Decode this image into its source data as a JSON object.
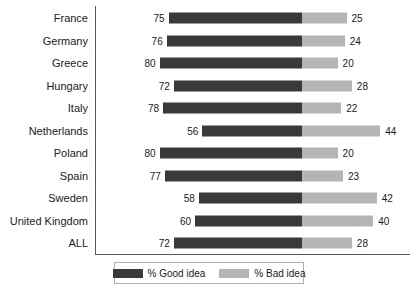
{
  "chart_data": {
    "type": "bar",
    "subtype": "stacked-horizontal-diverging",
    "title": "",
    "xlabel": "",
    "ylabel": "",
    "grid": false,
    "xlim": [
      0,
      100
    ],
    "categories": [
      "France",
      "Germany",
      "Greece",
      "Hungary",
      "Italy",
      "Netherlands",
      "Poland",
      "Spain",
      "Sweden",
      "United Kingdom",
      "ALL"
    ],
    "series": [
      {
        "name": "% Good idea",
        "color": "#3a3a3a",
        "values": [
          75,
          76,
          80,
          72,
          78,
          56,
          80,
          77,
          58,
          60,
          72
        ]
      },
      {
        "name": "% Bad idea",
        "color": "#b5b5b5",
        "values": [
          25,
          24,
          20,
          28,
          22,
          44,
          20,
          23,
          42,
          40,
          28
        ]
      }
    ],
    "legend": {
      "position": "bottom",
      "entries": [
        {
          "label": "% Good idea",
          "color": "#3a3a3a",
          "swatch": "good"
        },
        {
          "label": "% Bad idea",
          "color": "#b5b5b5",
          "swatch": "bad"
        }
      ]
    }
  },
  "colors": {
    "good": "#3a3a3a",
    "bad": "#b5b5b5",
    "axis": "#5a5a5a",
    "legend_border": "#b0b0b0",
    "text": "#1a1a1a",
    "background": "#ffffff"
  }
}
